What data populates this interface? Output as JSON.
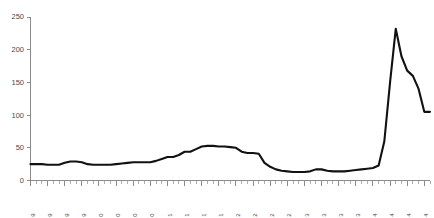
{
  "chart_data": {
    "type": "line",
    "title": "",
    "subtitle": "",
    "xlabel": "",
    "ylabel": "",
    "ylim": [
      0,
      250
    ],
    "y_ticks": [
      0,
      50,
      100,
      150,
      200,
      250
    ],
    "grid": false,
    "legend": false,
    "legend_position": "none",
    "line_color": "#111111",
    "axis_color": "#8c8c8c",
    "background_color": "#ffffff",
    "x_tick_interval_months": 3,
    "minor_tick_interval_months": 1,
    "x_tick_labels": [
      "Jan-19",
      "Apr-19",
      "Jul-19",
      "Oct-19",
      "Jan-20",
      "Apr-20",
      "Jul-20",
      "Oct-20",
      "Jan-21",
      "Apr-21",
      "Jul-21",
      "Oct-21",
      "Jan-22",
      "Apr-22",
      "Jul-22",
      "Oct-22",
      "Jan-23",
      "Apr-23",
      "Jul-23",
      "Oct-23",
      "Jan-24",
      "Apr-24",
      "Jul-24",
      "Oct-24"
    ],
    "x": [
      "Jan-19",
      "Feb-19",
      "Mar-19",
      "Apr-19",
      "May-19",
      "Jun-19",
      "Jul-19",
      "Aug-19",
      "Sep-19",
      "Oct-19",
      "Nov-19",
      "Dec-19",
      "Jan-20",
      "Feb-20",
      "Mar-20",
      "Apr-20",
      "May-20",
      "Jun-20",
      "Jul-20",
      "Aug-20",
      "Sep-20",
      "Oct-20",
      "Nov-20",
      "Dec-20",
      "Jan-21",
      "Feb-21",
      "Mar-21",
      "Apr-21",
      "May-21",
      "Jun-21",
      "Jul-21",
      "Aug-21",
      "Sep-21",
      "Oct-21",
      "Nov-21",
      "Dec-21",
      "Jan-22",
      "Feb-22",
      "Mar-22",
      "Apr-22",
      "May-22",
      "Jun-22",
      "Jul-22",
      "Aug-22",
      "Sep-22",
      "Oct-22",
      "Nov-22",
      "Dec-22",
      "Jan-23",
      "Feb-23",
      "Mar-23",
      "Apr-23",
      "May-23",
      "Jun-23",
      "Jul-23",
      "Aug-23",
      "Sep-23",
      "Oct-23",
      "Nov-23",
      "Dec-23",
      "Jan-24",
      "Feb-24",
      "Mar-24",
      "Apr-24",
      "May-24",
      "Jun-24",
      "Jul-24",
      "Aug-24",
      "Sep-24",
      "Oct-24",
      "Nov-24"
    ],
    "values": [
      25,
      25,
      25,
      24,
      24,
      24,
      27,
      29,
      29,
      28,
      25,
      24,
      24,
      24,
      24,
      25,
      26,
      27,
      28,
      28,
      28,
      28,
      30,
      33,
      36,
      36,
      39,
      44,
      44,
      48,
      52,
      53,
      53,
      52,
      52,
      51,
      50,
      44,
      42,
      42,
      41,
      27,
      21,
      17,
      15,
      14,
      13,
      13,
      13,
      14,
      17,
      17,
      15,
      14,
      14,
      14,
      15,
      16,
      17,
      18,
      19,
      23,
      60,
      150,
      232,
      190,
      168,
      160,
      140,
      105,
      105
    ]
  }
}
